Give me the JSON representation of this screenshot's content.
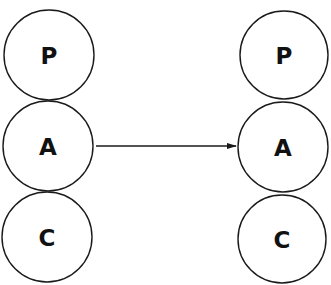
{
  "diagram": {
    "left_stack": {
      "nodes": [
        {
          "label": "P",
          "cx": 49,
          "cy": 55,
          "r": 45
        },
        {
          "label": "A",
          "cx": 48,
          "cy": 146,
          "r": 45
        },
        {
          "label": "C",
          "cx": 47,
          "cy": 237,
          "r": 45
        }
      ]
    },
    "right_stack": {
      "nodes": [
        {
          "label": "P",
          "cx": 284,
          "cy": 55,
          "r": 45
        },
        {
          "label": "A",
          "cx": 283,
          "cy": 147,
          "r": 45
        },
        {
          "label": "C",
          "cx": 282,
          "cy": 239,
          "r": 45
        }
      ]
    },
    "arrow": {
      "from": "left A",
      "to": "right A",
      "x1": 96,
      "y1": 146,
      "x2": 237,
      "y2": 146
    }
  }
}
